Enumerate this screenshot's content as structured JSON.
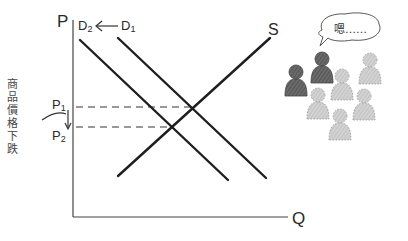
{
  "diagram": {
    "axes": {
      "y_label": "P",
      "x_label": "Q"
    },
    "curves": [
      {
        "id": "D1",
        "label": "D",
        "subscript": "1",
        "type": "demand"
      },
      {
        "id": "D2",
        "label": "D",
        "subscript": "2",
        "type": "demand"
      },
      {
        "id": "S",
        "label": "S",
        "type": "supply"
      }
    ],
    "shift_arrow": {
      "from": "D1",
      "to": "D2",
      "direction": "left"
    },
    "price_levels": [
      {
        "label": "P",
        "subscript": "1"
      },
      {
        "label": "P",
        "subscript": "2"
      }
    ],
    "side_note": "商品價格下跌",
    "speech_bubble": "嗯……",
    "colors": {
      "line": "#1e1e1e",
      "dash": "#333333",
      "dark_person": "#5a5a5a",
      "light_person": "#c8c8c8"
    }
  }
}
